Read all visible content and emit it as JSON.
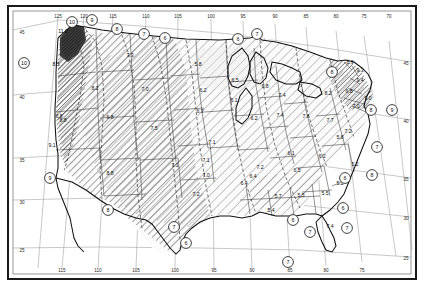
{
  "figure": {
    "kind": "contour-map",
    "region": "continental-united-states",
    "border_color": "#1a1a1a",
    "graticule_color": "#8a8a8a",
    "state_line_color": "#3a3a3a",
    "coast_color": "#111111",
    "hatch_color": "#4a4a4a",
    "shade_light": "#f2f2f2",
    "shade_mid": "#d9d9d9",
    "shade_dark": "#555555"
  },
  "axes": {
    "top_longitude_labels": [
      "125",
      "120",
      "115",
      "110",
      "105",
      "100",
      "95",
      "90",
      "85",
      "80",
      "75",
      "70"
    ],
    "bottom_longitude_labels": [
      "115",
      "110",
      "105",
      "100",
      "95",
      "90",
      "85",
      "80",
      "75"
    ],
    "left_latitude_labels": [
      "45",
      "40",
      "35",
      "30",
      "25"
    ],
    "right_latitude_labels": [
      "45",
      "40",
      "35",
      "30",
      "25"
    ]
  },
  "contour_labels": [
    {
      "value": "10",
      "x": 72,
      "y": 22
    },
    {
      "value": "9",
      "x": 92,
      "y": 20
    },
    {
      "value": "8",
      "x": 117,
      "y": 29
    },
    {
      "value": "7",
      "x": 144,
      "y": 34
    },
    {
      "value": "6",
      "x": 165,
      "y": 38
    },
    {
      "value": "6",
      "x": 238,
      "y": 39
    },
    {
      "value": "7",
      "x": 257,
      "y": 34
    },
    {
      "value": "8",
      "x": 332,
      "y": 72
    },
    {
      "value": "8",
      "x": 371,
      "y": 110
    },
    {
      "value": "9",
      "x": 392,
      "y": 110
    },
    {
      "value": "10",
      "x": 24,
      "y": 63
    },
    {
      "value": "9",
      "x": 50,
      "y": 178
    },
    {
      "value": "8",
      "x": 108,
      "y": 210
    },
    {
      "value": "7",
      "x": 174,
      "y": 227
    },
    {
      "value": "6",
      "x": 186,
      "y": 243
    },
    {
      "value": "6",
      "x": 293,
      "y": 220
    },
    {
      "value": "7",
      "x": 310,
      "y": 232
    },
    {
      "value": "7",
      "x": 347,
      "y": 228
    },
    {
      "value": "6",
      "x": 343,
      "y": 208
    },
    {
      "value": "6",
      "x": 345,
      "y": 178
    },
    {
      "value": "7",
      "x": 377,
      "y": 147
    },
    {
      "value": "8",
      "x": 372,
      "y": 175
    },
    {
      "value": "7",
      "x": 288,
      "y": 262
    }
  ],
  "station_values": [
    {
      "value": "11.0",
      "x": 63,
      "y": 33
    },
    {
      "value": "8.5",
      "x": 56,
      "y": 66
    },
    {
      "value": "7.3",
      "x": 130,
      "y": 57
    },
    {
      "value": "5.8",
      "x": 198,
      "y": 66
    },
    {
      "value": "8.2",
      "x": 95,
      "y": 90
    },
    {
      "value": "7.0",
      "x": 145,
      "y": 91
    },
    {
      "value": "6.2",
      "x": 203,
      "y": 92
    },
    {
      "value": "6.8",
      "x": 59,
      "y": 118
    },
    {
      "value": "8.8",
      "x": 63,
      "y": 122
    },
    {
      "value": "6.8",
      "x": 110,
      "y": 119
    },
    {
      "value": "6.3",
      "x": 200,
      "y": 113
    },
    {
      "value": "6.1",
      "x": 234,
      "y": 102
    },
    {
      "value": "6.5",
      "x": 235,
      "y": 82
    },
    {
      "value": "6.8",
      "x": 265,
      "y": 88
    },
    {
      "value": "6.2",
      "x": 254,
      "y": 120
    },
    {
      "value": "7.4",
      "x": 282,
      "y": 97
    },
    {
      "value": "7.4",
      "x": 280,
      "y": 117
    },
    {
      "value": "7.6",
      "x": 306,
      "y": 118
    },
    {
      "value": "8.2",
      "x": 328,
      "y": 95
    },
    {
      "value": "7.7",
      "x": 330,
      "y": 122
    },
    {
      "value": "7.5",
      "x": 154,
      "y": 130
    },
    {
      "value": "7.1",
      "x": 212,
      "y": 144
    },
    {
      "value": "9.1",
      "x": 52,
      "y": 147
    },
    {
      "value": "8.8",
      "x": 110,
      "y": 175
    },
    {
      "value": "7.1",
      "x": 175,
      "y": 167
    },
    {
      "value": "7.1",
      "x": 206,
      "y": 162
    },
    {
      "value": "7.0",
      "x": 206,
      "y": 177
    },
    {
      "value": "7.2",
      "x": 260,
      "y": 169
    },
    {
      "value": "7.2",
      "x": 196,
      "y": 196
    },
    {
      "value": "6.4",
      "x": 244,
      "y": 185
    },
    {
      "value": "6.1",
      "x": 291,
      "y": 155
    },
    {
      "value": "6.5",
      "x": 297,
      "y": 172
    },
    {
      "value": "6.4",
      "x": 253,
      "y": 178
    },
    {
      "value": "5.7",
      "x": 278,
      "y": 198
    },
    {
      "value": "5.5",
      "x": 301,
      "y": 197
    },
    {
      "value": "5.5",
      "x": 325,
      "y": 195
    },
    {
      "value": "5.4",
      "x": 271,
      "y": 212
    },
    {
      "value": "5.2",
      "x": 340,
      "y": 185
    },
    {
      "value": "5.2",
      "x": 355,
      "y": 166
    },
    {
      "value": "6.2",
      "x": 322,
      "y": 158
    },
    {
      "value": "7.4",
      "x": 330,
      "y": 228
    },
    {
      "value": "8.9",
      "x": 350,
      "y": 64
    },
    {
      "value": "9.3",
      "x": 360,
      "y": 72
    },
    {
      "value": "9.4",
      "x": 360,
      "y": 82
    },
    {
      "value": "9.0",
      "x": 368,
      "y": 100
    },
    {
      "value": "6.8",
      "x": 349,
      "y": 93
    },
    {
      "value": "7.0",
      "x": 356,
      "y": 108
    },
    {
      "value": "7.2",
      "x": 348,
      "y": 133
    },
    {
      "value": "5.8",
      "x": 340,
      "y": 139
    }
  ]
}
